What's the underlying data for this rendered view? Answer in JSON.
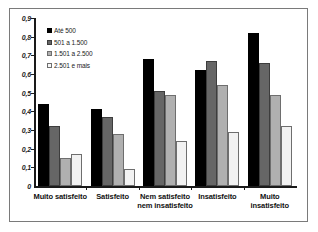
{
  "chart_data": {
    "type": "bar",
    "title": "",
    "subtitle": "",
    "xlabel": "",
    "ylabel": "",
    "ylim": [
      0,
      0.9
    ],
    "ytick_step": 0.1,
    "grid": false,
    "legend_position": "top-left",
    "ytick_labels": [
      "0,9",
      "0,8",
      "0,7",
      "0,6",
      "0,5",
      "0,4",
      "0,3",
      "0,2",
      "0,1",
      "0"
    ],
    "ytick_values": [
      0.9,
      0.8,
      0.7,
      0.6,
      0.5,
      0.4,
      0.3,
      0.2,
      0.1,
      0
    ],
    "categories": [
      "Muito satisfeito",
      "Satisfeito",
      "Nem satisfeito nem insatisfeito",
      "Insatisfeito",
      "Muito insatisfeito"
    ],
    "category_lines": [
      [
        "Muito satisfeito"
      ],
      [
        "Satisfeito"
      ],
      [
        "Nem satisfeito",
        "nem insatisfeito"
      ],
      [
        "Insatisfeito"
      ],
      [
        "Muito",
        "insatisfeito"
      ]
    ],
    "series": [
      {
        "name": "Até 500",
        "color": "#000000",
        "values": [
          0.44,
          0.41,
          0.68,
          0.62,
          0.82
        ]
      },
      {
        "name": "501 a 1.500",
        "color": "#666666",
        "values": [
          0.32,
          0.37,
          0.51,
          0.67,
          0.66
        ]
      },
      {
        "name": "1.501 a 2.500",
        "color": "#b0b0b0",
        "values": [
          0.15,
          0.28,
          0.49,
          0.54,
          0.49
        ]
      },
      {
        "name": "2.501 e mais",
        "color": "#f2f2f2",
        "values": [
          0.17,
          0.09,
          0.24,
          0.29,
          0.32
        ]
      }
    ]
  }
}
